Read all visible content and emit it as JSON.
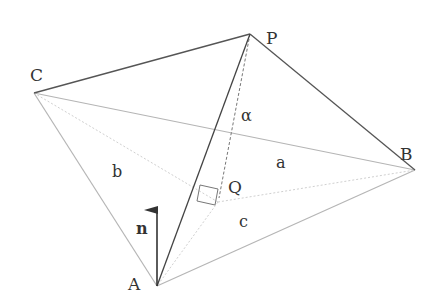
{
  "diagram": {
    "vertices": {
      "A": {
        "label": "A",
        "x": 157,
        "y": 286
      },
      "B": {
        "label": "B",
        "x": 415,
        "y": 170
      },
      "C": {
        "label": "C",
        "x": 34,
        "y": 93
      },
      "P": {
        "label": "P",
        "x": 250,
        "y": 34
      },
      "Q": {
        "label": "Q",
        "x": 218,
        "y": 202
      }
    },
    "face_labels": {
      "a": "a",
      "b": "b",
      "c": "c"
    },
    "angle_label": "α",
    "normal_label": "n",
    "colors": {
      "dark_edge": "#555555",
      "light_edge": "#b5b5b5",
      "dotted": "#d0d0d0",
      "text": "#333333",
      "arrow": "#333333"
    }
  }
}
